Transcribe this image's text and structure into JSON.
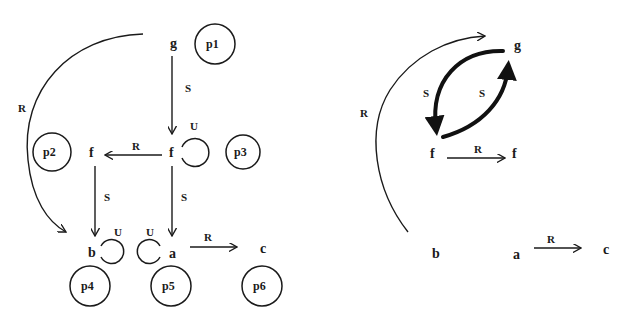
{
  "left_diagram": {
    "nodes": {
      "g": "g",
      "f_right": "f",
      "f_left": "f",
      "b": "b",
      "a": "a",
      "c": "c"
    },
    "edge_labels": {
      "g_to_f": "S",
      "f_to_f": "R",
      "g_to_b_arc": "R",
      "f_left_to_b": "S",
      "f_right_to_a": "S",
      "a_to_c": "R",
      "loop_f": "U",
      "loop_b": "U",
      "loop_a": "U"
    },
    "places": [
      "p1",
      "p2",
      "p3",
      "p4",
      "p5",
      "p6"
    ]
  },
  "right_diagram": {
    "nodes": {
      "g": "g",
      "f_left": "f",
      "f_right": "f",
      "b": "b",
      "a": "a",
      "c": "c"
    },
    "edge_labels": {
      "arc_b_to_g": "R",
      "g_to_f_thick": "S",
      "f_to_g_thick": "S",
      "f_to_f": "R",
      "a_to_c": "R"
    }
  }
}
